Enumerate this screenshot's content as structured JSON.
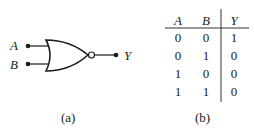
{
  "figure_a": {
    "caption": "(a)",
    "gate_type": "NOR",
    "inputs": [
      "A",
      "B"
    ],
    "output": "Y"
  },
  "figure_b": {
    "caption": "(b)",
    "headers": [
      "A",
      "B",
      "Y"
    ],
    "rows": [
      [
        "0",
        "0",
        "1"
      ],
      [
        "0",
        "1",
        "0"
      ],
      [
        "1",
        "0",
        "0"
      ],
      [
        "1",
        "1",
        "0"
      ]
    ]
  }
}
